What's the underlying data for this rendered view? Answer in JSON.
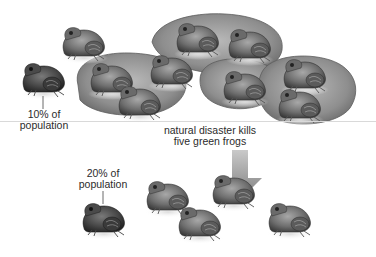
{
  "diagram": {
    "type": "population bottleneck illustration",
    "colors": {
      "background": "#ffffff",
      "lily_pad": "#8f8f8f",
      "lily_pad_edge": "#5e5e5e",
      "frog_dark": "#3d3d3d",
      "frog_mid": "#7a7a7a",
      "frog_light": "#b5b5b5",
      "arrow": "#8a8a8a",
      "text": "#2b2b2b",
      "divider": "#d9d9d9"
    },
    "before": {
      "total_frogs": 10,
      "brown_frogs": 1,
      "green_frogs_on_pads": 8,
      "other_frogs_off_pad": 1,
      "label_line1": "10% of",
      "label_line2": "population"
    },
    "event": {
      "line1": "natural disaster kills",
      "line2": "five green frogs"
    },
    "after": {
      "total_frogs": 5,
      "label_line1": "20% of",
      "label_line2": "population"
    }
  }
}
